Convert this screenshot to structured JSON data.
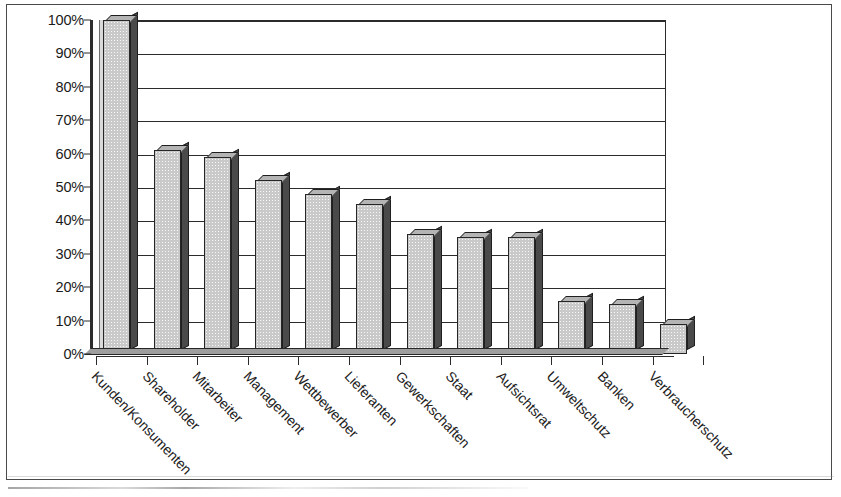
{
  "chart_data": {
    "type": "bar",
    "title": "",
    "subtitle": "",
    "xlabel": "",
    "ylabel": "",
    "ylim": [
      0,
      100
    ],
    "y_unit": "%",
    "grid": true,
    "legend": "none",
    "orientation": "vertical",
    "style": "3d-bar-grayscale-scan",
    "categories": [
      "Kunden/Konsumenten",
      "Shareholder",
      "Mitarbeiter",
      "Management",
      "Wettbewerber",
      "Lieferanten",
      "Gewerkschaften",
      "Staat",
      "Aufsichtsrat",
      "Umweltschutz",
      "Banken",
      "Verbraucherschutz"
    ],
    "values": [
      100,
      61,
      59,
      52,
      48,
      45,
      36,
      35,
      35,
      16,
      15,
      9
    ],
    "ytick_labels": [
      "0%",
      "10%",
      "20%",
      "30%",
      "40%",
      "50%",
      "60%",
      "70%",
      "80%",
      "90%",
      "100%"
    ],
    "ytick_values": [
      0,
      10,
      20,
      30,
      40,
      50,
      60,
      70,
      80,
      90,
      100
    ]
  }
}
